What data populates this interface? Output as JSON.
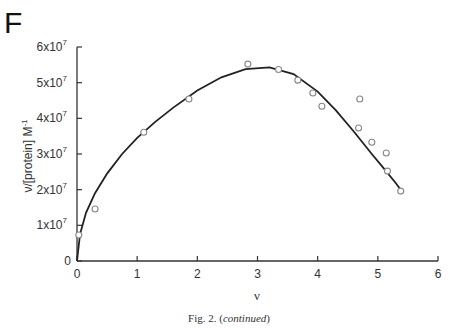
{
  "panel_letter": "F",
  "caption": {
    "prefix": "Fig. 2. (",
    "italic": "continued",
    "suffix": ")"
  },
  "chart_data": {
    "type": "scatter",
    "title": "",
    "xlabel": "ν",
    "ylabel": "ν/[protein] M⁻¹",
    "xlim": [
      0,
      6
    ],
    "ylim": [
      0,
      60000000
    ],
    "xticks": [
      0,
      1,
      2,
      3,
      4,
      5,
      6
    ],
    "xtick_labels": [
      "0",
      "1",
      "2",
      "3",
      "4",
      "5",
      "6"
    ],
    "yticks": [
      0,
      10000000,
      20000000,
      30000000,
      40000000,
      50000000,
      60000000
    ],
    "ytick_labels": [
      "0",
      "1x10^7",
      "2x10^7",
      "3x10^7",
      "4x10^7",
      "5x10^7",
      "6x10^7"
    ],
    "grid": false,
    "legend": null,
    "series": [
      {
        "name": "data",
        "type": "scatter",
        "marker": "open-circle",
        "color": "#888888",
        "x": [
          0.03,
          0.3,
          1.11,
          1.86,
          2.84,
          3.35,
          3.67,
          3.92,
          4.07,
          4.68,
          4.7,
          4.9,
          5.14,
          5.16,
          5.38
        ],
        "y": [
          7300000,
          14600000,
          36100000,
          45400000,
          55200000,
          53700000,
          50700000,
          47100000,
          43400000,
          37300000,
          45400000,
          33300000,
          30300000,
          25200000,
          19600000
        ]
      },
      {
        "name": "fit",
        "type": "line",
        "color": "#222222",
        "x": [
          0,
          0.05,
          0.15,
          0.3,
          0.5,
          0.75,
          1.0,
          1.3,
          1.6,
          2.0,
          2.4,
          2.8,
          3.2,
          3.6,
          4.0,
          4.3,
          4.6,
          4.9,
          5.1,
          5.3,
          5.38
        ],
        "y": [
          0,
          7500000,
          13500000,
          19000000,
          24500000,
          30000000,
          34500000,
          39000000,
          43000000,
          47800000,
          51500000,
          53800000,
          54300000,
          52400000,
          47500000,
          42300000,
          36300000,
          30000000,
          26000000,
          21800000,
          20000000
        ]
      }
    ]
  }
}
